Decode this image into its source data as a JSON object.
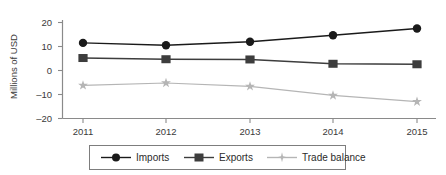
{
  "chart_data": {
    "type": "line",
    "title": "",
    "xlabel": "",
    "ylabel": "Millions of USD",
    "categories": [
      "2011",
      "2012",
      "2013",
      "2014",
      "2015"
    ],
    "x": [
      2011,
      2012,
      2013,
      2014,
      2015
    ],
    "ylim": [
      -20,
      20
    ],
    "yticks": [
      20,
      10,
      0,
      -10,
      -20
    ],
    "ytick_labels": [
      "20",
      "10",
      "0",
      "–10",
      "–20"
    ],
    "grid": false,
    "legend_position": "bottom",
    "series": [
      {
        "name": "Imports",
        "marker": "circle",
        "color": "#1a1a1a",
        "values": [
          11.5,
          10.5,
          12.0,
          14.7,
          17.5
        ]
      },
      {
        "name": "Exports",
        "marker": "square",
        "color": "#3d3d3d",
        "values": [
          5.2,
          4.7,
          4.6,
          2.8,
          2.6
        ]
      },
      {
        "name": "Trade balance",
        "marker": "star",
        "color": "#b5b5b5",
        "values": [
          -6.2,
          -5.2,
          -6.6,
          -10.4,
          -13.0
        ]
      }
    ]
  },
  "axes": {
    "y_title": "Millions of USD",
    "y_tick_0": "20",
    "y_tick_1": "10",
    "y_tick_2": "0",
    "y_tick_3": "–10",
    "y_tick_4": "–20",
    "x_tick_0": "2011",
    "x_tick_1": "2012",
    "x_tick_2": "2013",
    "x_tick_3": "2014",
    "x_tick_4": "2015"
  },
  "legend": {
    "items": [
      {
        "label": "Imports"
      },
      {
        "label": "Exports"
      },
      {
        "label": "Trade balance"
      }
    ]
  },
  "colors": {
    "imports": "#1a1a1a",
    "exports": "#3d3d3d",
    "trade_balance": "#b5b5b5",
    "axis": "#8a8a8a",
    "text": "#3a3a3a"
  }
}
